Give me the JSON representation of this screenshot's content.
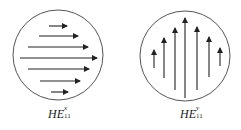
{
  "diagram": {
    "panels": [
      {
        "id": "hex",
        "label_main": "HE",
        "label_sup": "x",
        "label_sub": "11",
        "polarization": "horizontal",
        "circle": {
          "cx": 58,
          "cy": 55,
          "r": 45
        },
        "arrows": [
          {
            "x1": 49,
            "y1": 26,
            "x2": 67,
            "y2": 26
          },
          {
            "x1": 39,
            "y1": 36,
            "x2": 78,
            "y2": 36
          },
          {
            "x1": 28,
            "y1": 47,
            "x2": 88,
            "y2": 47
          },
          {
            "x1": 20,
            "y1": 58,
            "x2": 97,
            "y2": 58
          },
          {
            "x1": 28,
            "y1": 69,
            "x2": 89,
            "y2": 69
          },
          {
            "x1": 40,
            "y1": 81,
            "x2": 80,
            "y2": 81
          },
          {
            "x1": 51,
            "y1": 92,
            "x2": 68,
            "y2": 92
          }
        ]
      },
      {
        "id": "hey",
        "label_main": "HE",
        "label_sup": "y",
        "label_sub": "11",
        "polarization": "vertical",
        "circle": {
          "cx": 185,
          "cy": 56,
          "r": 45
        },
        "arrows": [
          {
            "x1": 154,
            "y1": 68,
            "x2": 154,
            "y2": 50
          },
          {
            "x1": 164,
            "y1": 78,
            "x2": 164,
            "y2": 38
          },
          {
            "x1": 175,
            "y1": 90,
            "x2": 175,
            "y2": 28
          },
          {
            "x1": 185,
            "y1": 98,
            "x2": 185,
            "y2": 18
          },
          {
            "x1": 197,
            "y1": 90,
            "x2": 197,
            "y2": 27
          },
          {
            "x1": 209,
            "y1": 77,
            "x2": 209,
            "y2": 37
          },
          {
            "x1": 220,
            "y1": 66,
            "x2": 220,
            "y2": 48
          }
        ]
      }
    ],
    "colors": {
      "circle": "#555555",
      "arrow": "#222222",
      "text": "#222222"
    }
  }
}
